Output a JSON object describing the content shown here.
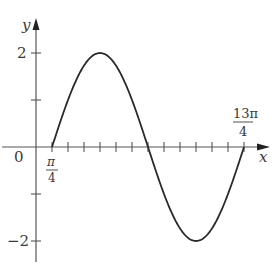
{
  "chart_data": {
    "type": "line",
    "title": "",
    "function": "y = 2 sin((2/3)(x - π/4))",
    "xlabel": "x",
    "ylabel": "y",
    "x_unit": "π/4",
    "x_tick_labels": [
      {
        "value": 0,
        "label": "0"
      },
      {
        "value": 0.7854,
        "label": "π/4"
      },
      {
        "value": 10.2102,
        "label": "13π/4"
      }
    ],
    "y_tick_labels": [
      {
        "value": 2,
        "label": "2"
      },
      {
        "value": -2,
        "label": "−2"
      }
    ],
    "y_minor_ticks": [
      1,
      -1
    ],
    "x_ticks_every": "π/4",
    "xlim": [
      0,
      10.9956
    ],
    "ylim": [
      -2.45,
      2.7
    ],
    "grid": false,
    "legend": null,
    "series": [
      {
        "name": "curve",
        "x_start": "π/4",
        "x_end": "13π/4",
        "amplitude": 2,
        "period": "3π",
        "points": [
          {
            "x": "π/4",
            "y": 0
          },
          {
            "x": "π",
            "y": 2
          },
          {
            "x": "7π/4",
            "y": 0
          },
          {
            "x": "5π/2",
            "y": -2
          },
          {
            "x": "13π/4",
            "y": 0
          }
        ]
      }
    ]
  },
  "labels": {
    "y_axis": "y",
    "x_axis": "x",
    "origin": "0",
    "y_pos2": "2",
    "y_neg2": "−2",
    "pi4_num": "π",
    "pi4_den": "4",
    "end_num": "13π",
    "end_den": "4"
  }
}
